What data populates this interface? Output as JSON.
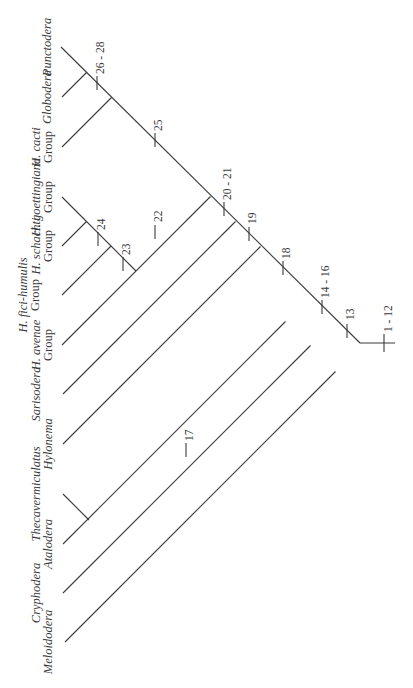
{
  "diagram": {
    "type": "cladogram",
    "orientation": "rotated-90-ccw",
    "line_color": "#3a3a3a",
    "background": "#ffffff"
  },
  "taxa": [
    {
      "id": "punctodera",
      "label": "Punctodera",
      "style": "italic",
      "group_suffix": ""
    },
    {
      "id": "globodera",
      "label": "Globodera",
      "style": "italic",
      "group_suffix": ""
    },
    {
      "id": "h_cacti",
      "label": "H. cacti",
      "style": "italic",
      "group_suffix": "Group"
    },
    {
      "id": "h_goettingiana",
      "label": "H. goettingiana",
      "style": "italic",
      "group_suffix": "Group"
    },
    {
      "id": "h_schachti",
      "label": "H. schachti",
      "style": "italic",
      "group_suffix": "Group"
    },
    {
      "id": "h_fici",
      "label": "H. fici-humulis",
      "style": "italic",
      "group_suffix": "Group"
    },
    {
      "id": "h_avenae",
      "label": "H. avenae",
      "style": "italic",
      "group_suffix": "Group"
    },
    {
      "id": "sarisodera",
      "label": "Sarisodera",
      "style": "italic",
      "group_suffix": ""
    },
    {
      "id": "hylonema",
      "label": "Hylonema",
      "style": "italic",
      "group_suffix": ""
    },
    {
      "id": "thecavermiculatus",
      "label": "Thecavermiculatus",
      "style": "italic",
      "group_suffix": ""
    },
    {
      "id": "ataloder",
      "label": "Atalodera",
      "style": "italic",
      "group_suffix": ""
    },
    {
      "id": "cryphodera",
      "label": "Cryphodera",
      "style": "italic",
      "group_suffix": ""
    },
    {
      "id": "meloidodera",
      "label": "Meloidodera",
      "style": "italic",
      "group_suffix": ""
    }
  ],
  "character_marks": [
    {
      "label": "1 - 12",
      "position": "root stem"
    },
    {
      "label": "13",
      "position": "spine after Meloidodera"
    },
    {
      "label": "14 - 16",
      "position": "spine after Cryphodera"
    },
    {
      "label": "17",
      "position": "Hylonema branch"
    },
    {
      "label": "18",
      "position": "spine after Atalodera+Thecavermiculatus"
    },
    {
      "label": "19",
      "position": "spine after Hylonema"
    },
    {
      "label": "20 - 21",
      "position": "spine after Sarisodera"
    },
    {
      "label": "22",
      "position": "Heterodera clade stem"
    },
    {
      "label": "23",
      "position": "H. fici + schachti + goettingiana stem"
    },
    {
      "label": "24",
      "position": "H. schachti + goettingiana stem"
    },
    {
      "label": "25",
      "position": "spine after Heterodera clade"
    },
    {
      "label": "26 - 28",
      "position": "Globodera + Punctodera stem"
    }
  ]
}
